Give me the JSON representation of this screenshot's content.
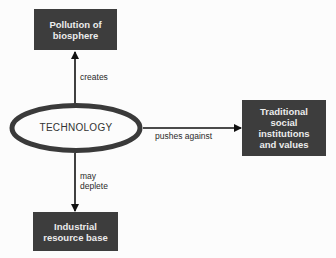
{
  "diagram": {
    "center_node": {
      "label": "TECHNOLOGY",
      "shape": "ellipse"
    },
    "nodes": {
      "top": {
        "lines": [
          "Pollution of",
          "biosphere"
        ]
      },
      "right": {
        "lines": [
          "Traditional",
          "social",
          "institutions",
          "and values"
        ]
      },
      "bottom": {
        "lines": [
          "Industrial",
          "resource base"
        ]
      }
    },
    "edges": [
      {
        "from": "TECHNOLOGY",
        "to": "Pollution of biosphere",
        "label_lines": [
          "creates"
        ]
      },
      {
        "from": "TECHNOLOGY",
        "to": "Traditional social institutions and values",
        "label_lines": [
          "pushes against"
        ]
      },
      {
        "from": "TECHNOLOGY",
        "to": "Industrial resource base",
        "label_lines": [
          "may",
          "deplete"
        ]
      }
    ],
    "colors": {
      "box_fill": "#3d3d3d",
      "box_text": "#ececec",
      "line": "#111111",
      "ellipse_stroke": "#3a3a3a"
    }
  }
}
